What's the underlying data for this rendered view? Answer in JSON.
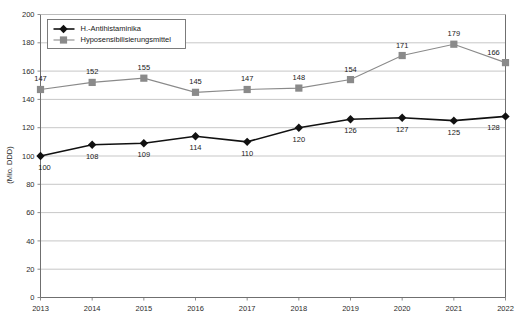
{
  "chart_data": {
    "type": "line",
    "title": "",
    "xlabel": "",
    "ylabel": "(Mio. DDD)",
    "ylim": [
      0,
      200
    ],
    "ytick_step": 20,
    "yticks": [
      "0",
      "20",
      "40",
      "60",
      "80",
      "100",
      "120",
      "140",
      "160",
      "180",
      "200"
    ],
    "grid": true,
    "legend_position": "top-left-inside",
    "categories": [
      "2013",
      "2014",
      "2015",
      "2016",
      "2017",
      "2018",
      "2019",
      "2020",
      "2021",
      "2022"
    ],
    "series": [
      {
        "name": "H.-Antihistaminika",
        "marker": "diamond",
        "color": "#111111",
        "label_position": "below",
        "values": [
          100,
          108,
          109,
          114,
          110,
          120,
          126,
          127,
          125,
          128
        ]
      },
      {
        "name": "Hyposensibilisierungsmittel",
        "marker": "square",
        "color": "#8a8a8a",
        "label_position": "above",
        "values": [
          147,
          152,
          155,
          145,
          147,
          148,
          154,
          171,
          179,
          166
        ]
      }
    ]
  },
  "colors": {
    "series_dark": "#111111",
    "series_gray": "#8a8a8a",
    "grid": "#b9b9b9",
    "axis": "#6f6f6f",
    "text": "#1a1a1a",
    "background": "#ffffff"
  }
}
